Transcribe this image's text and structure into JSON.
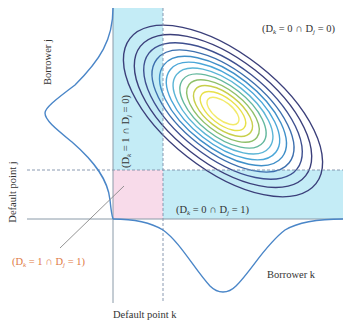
{
  "diagram": {
    "colors": {
      "band_blue": "#c4ecf6",
      "default_region_pink": "#f8dbea",
      "density_curve": "#4a86c8",
      "axis": "#8a9aa8",
      "dashed": "#7d8fa8",
      "label_text": "#333333",
      "highlight_label": "#e07a45",
      "leader_line": "#888888",
      "contour_colors": [
        "#3b3f7a",
        "#3b3f7a",
        "#3e4f8f",
        "#3d6fae",
        "#3f8fc8",
        "#4aa6d8",
        "#5bb5d6",
        "#64b89e",
        "#8fc06a",
        "#c8cf4a",
        "#e8e14a",
        "#f2ea6a"
      ]
    },
    "axes": {
      "x_label": "Borrower k",
      "y_label": "Borrower j",
      "x_threshold_label": "Default point k",
      "y_threshold_label": "Default point j"
    },
    "regions": {
      "no_default": "(Dₖ = 0 ∩ Dⱼ = 0)",
      "k_default_only": "(Dₖ = 1 ∩ Dⱼ = 0)",
      "j_default_only": "(Dₖ = 0 ∩ Dⱼ = 1)",
      "joint_default": "(Dₖ = 1 ∩ Dⱼ = 1)"
    },
    "region_parts": {
      "no_default": {
        "open": "(D",
        "sub1": "k",
        "mid1": " = 0 ∩ D",
        "sub2": "j",
        "end": " = 0)"
      },
      "k_default_only": {
        "open": "(D",
        "sub1": "k",
        "mid1": " = 1 ∩ D",
        "sub2": "j",
        "end": " = 0)"
      },
      "j_default_only": {
        "open": "(D",
        "sub1": "k",
        "mid1": " = 0 ∩ D",
        "sub2": "j",
        "end": " = 1)"
      },
      "joint_default": {
        "open": "(D",
        "sub1": "k",
        "mid1": " = 1 ∩ D",
        "sub2": "j",
        "end": " = 1)"
      }
    },
    "contours": {
      "count": 12,
      "center": [
        223,
        111
      ],
      "rotation_deg": 38
    }
  }
}
